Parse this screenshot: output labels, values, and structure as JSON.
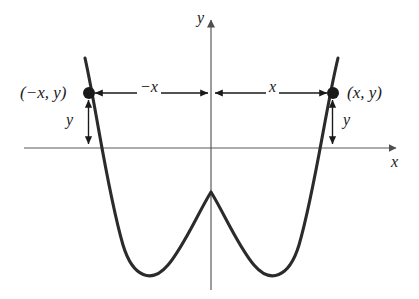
{
  "figure": {
    "kind": "even-function-symmetry-graph",
    "background_color": "#ffffff",
    "curve_color": "#2b2b2b",
    "axis_color": "#5a5a5a",
    "annotation_color": "#1a1a1a",
    "point_color": "#1a1a1a"
  },
  "axes": {
    "y_label": "y",
    "x_label": "x",
    "origin_px": [
      211,
      148
    ],
    "x_axis_y_px": 148,
    "y_axis_x_px": 211,
    "x_axis_left_px": 24,
    "x_axis_right_px": 400,
    "y_axis_top_px": 16,
    "y_axis_bottom_px": 290
  },
  "labels": {
    "point_left": "(−x, y)",
    "point_right": "(x, y)",
    "segment_left": "−x",
    "segment_right": "x",
    "height_left": "y",
    "height_right": "y"
  },
  "points": [
    {
      "name": "left-point",
      "label": "(−x, y)",
      "px": [
        89,
        93
      ]
    },
    {
      "name": "right-point",
      "label": "(x, y)",
      "px": [
        333,
        93
      ]
    }
  ],
  "measure_arrows": [
    {
      "name": "horizontal-left-span",
      "label": "−x",
      "from_px": [
        89,
        93
      ],
      "to_px": [
        211,
        93
      ],
      "heads": "both"
    },
    {
      "name": "horizontal-right-span",
      "label": "x",
      "from_px": [
        211,
        93
      ],
      "to_px": [
        333,
        93
      ],
      "heads": "both"
    },
    {
      "name": "vertical-left-span",
      "label": "y",
      "from_px": [
        89,
        95
      ],
      "to_px": [
        89,
        148
      ],
      "heads": "both"
    },
    {
      "name": "vertical-right-span",
      "label": "y",
      "from_px": [
        333,
        95
      ],
      "to_px": [
        333,
        148
      ],
      "heads": "both"
    }
  ],
  "chart_data": {
    "type": "line",
    "title": "",
    "xlabel": "x",
    "ylabel": "y",
    "grid": false,
    "legend": "none",
    "symmetry": "even / reflection about the y-axis",
    "annotations": [
      "(−x, y)",
      "(x, y)",
      "−x",
      "x",
      "y",
      "y"
    ],
    "curve_path_px": "M 85,58 C 97,112 107,190 123,245 C 133,278 152,284 168,265 C 184,246 197,215 211,192 C 225,215 238,246 254,265 C 270,284 289,278 299,245 C 315,190 325,112 338,58",
    "features": [
      {
        "name": "local-maximum",
        "px": [
          211,
          192
        ]
      },
      {
        "name": "left-minimum",
        "px": [
          140,
          269
        ]
      },
      {
        "name": "right-minimum",
        "px": [
          282,
          269
        ]
      },
      {
        "name": "left-branch-top",
        "px": [
          85,
          58
        ]
      },
      {
        "name": "right-branch-top",
        "px": [
          338,
          58
        ]
      },
      {
        "name": "left-x-intercept",
        "px": [
          104,
          148
        ]
      },
      {
        "name": "right-x-intercept",
        "px": [
          318,
          148
        ]
      }
    ]
  }
}
